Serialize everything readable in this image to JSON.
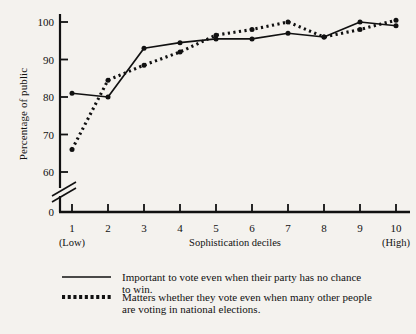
{
  "chart_data": {
    "type": "line",
    "title": "",
    "xlabel": "Sophistication deciles",
    "ylabel": "Percentage of public",
    "categories": [
      "1",
      "2",
      "3",
      "4",
      "5",
      "6",
      "7",
      "8",
      "9",
      "10"
    ],
    "x_end_labels": {
      "low": "(Low)",
      "high": "(High)"
    },
    "xlim": [
      1,
      10
    ],
    "ylim": [
      60,
      100
    ],
    "y_axis_break": true,
    "y_zero_label": "0",
    "yticks": [
      60,
      70,
      80,
      90,
      100
    ],
    "ytick_labels": [
      "60",
      "70",
      "80",
      "90",
      "100"
    ],
    "grid": false,
    "legend_position": "below",
    "series": [
      {
        "name": "Important to vote even when their party has no chance to win.",
        "style": "solid",
        "color": "#111111",
        "values": [
          81.0,
          80.0,
          93.0,
          94.5,
          95.5,
          95.5,
          97.0,
          96.0,
          100.0,
          99.0
        ]
      },
      {
        "name": "Matters whether they vote even when many other people are voting in national elections.",
        "style": "dotted",
        "color": "#111111",
        "values": [
          66.0,
          84.5,
          88.5,
          92.0,
          96.5,
          98.0,
          100.0,
          96.0,
          98.0,
          100.5
        ]
      }
    ]
  },
  "legend": {
    "items": [
      {
        "swatch": "solid-line-swatch",
        "line1": "Important to vote even when their party has no chance",
        "line2": "to win."
      },
      {
        "swatch": "dotted-line-swatch",
        "line1": "Matters whether they vote even when many other people",
        "line2": "are voting in national elections."
      }
    ]
  },
  "colors": {
    "ink": "#111111",
    "background": "#f4f2ee"
  }
}
